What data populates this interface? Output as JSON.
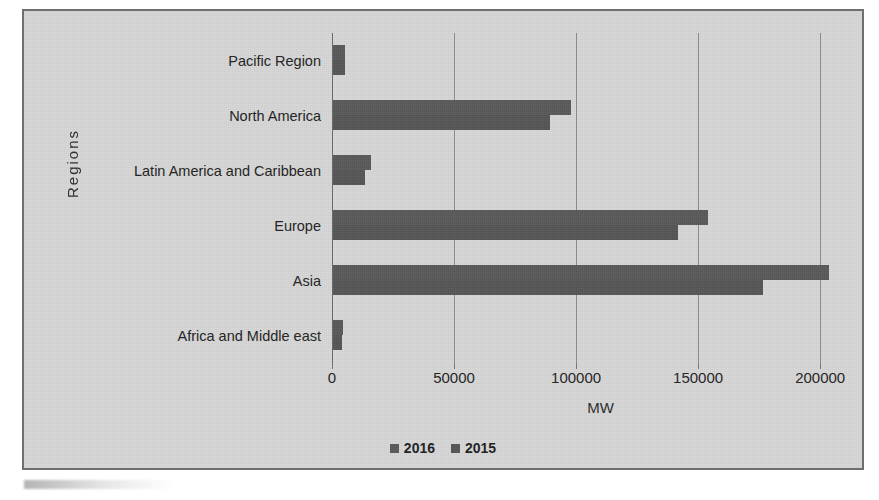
{
  "chart_data": {
    "type": "bar",
    "orientation": "horizontal",
    "title": "",
    "xlabel": "MW",
    "ylabel": "Regions",
    "xlim": [
      0,
      220000
    ],
    "xticks": [
      0,
      50000,
      100000,
      150000,
      200000
    ],
    "xtick_labels": [
      "0",
      "50000",
      "100000",
      "150000",
      "200000"
    ],
    "grid": true,
    "legend_position": "bottom",
    "categories": [
      "Pacific Region",
      "North America",
      "Latin America and Caribbean",
      "Europe",
      "Asia",
      "Africa and Middle east"
    ],
    "series": [
      {
        "name": "2016",
        "color": "#5a5a5a",
        "values": [
          5000,
          97500,
          15500,
          153500,
          203000,
          4000
        ]
      },
      {
        "name": "2015",
        "color": "#565656",
        "values": [
          4800,
          89000,
          13000,
          141500,
          176000,
          3600
        ]
      }
    ]
  },
  "legend": {
    "items": [
      {
        "label": "2016",
        "color": "#5a5a5a"
      },
      {
        "label": "2015",
        "color": "#565656"
      }
    ]
  },
  "axes": {
    "y_title": "Regions",
    "x_title": "MW"
  },
  "colors": {
    "plot_background": "#d7d7d7",
    "frame_border": "#6f6f6f",
    "gridline": "#8d8d8d",
    "bar_2016": "#5a5a5a",
    "bar_2015": "#565656",
    "text": "#232323"
  }
}
